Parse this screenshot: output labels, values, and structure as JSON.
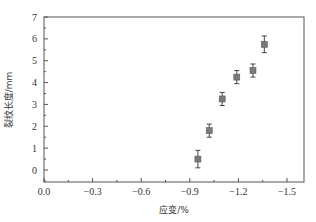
{
  "chart_data": {
    "type": "scatter",
    "title": "",
    "xlabel": "应变/%",
    "ylabel": "裂纹长度/mm",
    "xlim": [
      0.0,
      -1.6
    ],
    "ylim": [
      -0.5,
      7
    ],
    "xticks": [
      "0.0",
      "-0.3",
      "-0.6",
      "-0.9",
      "-1.2",
      "-1.5"
    ],
    "xtick_values": [
      0.0,
      -0.3,
      -0.6,
      -0.9,
      -1.2,
      -1.5
    ],
    "yticks": [
      "0",
      "1",
      "2",
      "3",
      "4",
      "5",
      "6",
      "7"
    ],
    "ytick_values": [
      0,
      1,
      2,
      3,
      4,
      5,
      6,
      7
    ],
    "grid": false,
    "legend": null,
    "series": [
      {
        "name": "裂纹长度",
        "marker": "square",
        "color": "#7a7a7a",
        "error_color": "#444444",
        "x": [
          -0.95,
          -1.02,
          -1.1,
          -1.19,
          -1.29,
          -1.36
        ],
        "y": [
          0.5,
          1.8,
          3.25,
          4.25,
          4.55,
          5.75
        ],
        "yerr": [
          0.4,
          0.3,
          0.3,
          0.3,
          0.3,
          0.38
        ]
      }
    ]
  },
  "colors": {
    "axis": "#555555",
    "text": "#333333"
  }
}
